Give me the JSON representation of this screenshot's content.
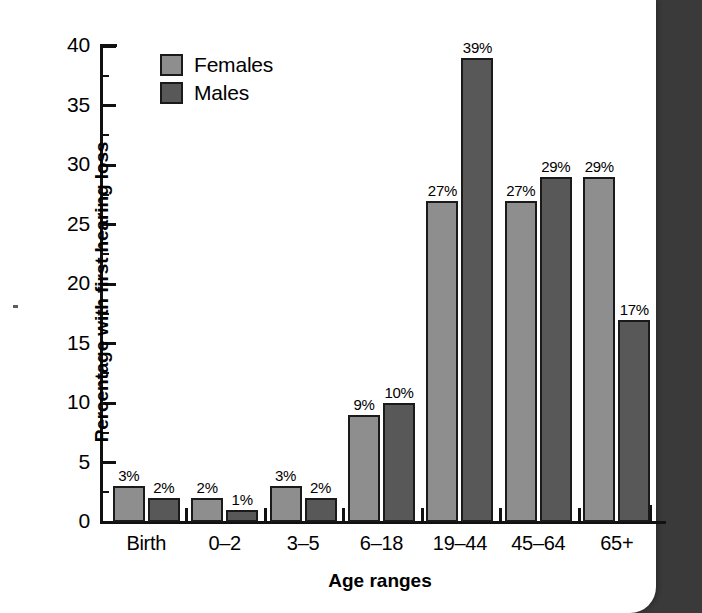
{
  "chart_data": {
    "type": "bar",
    "title": "",
    "xlabel": "Age ranges",
    "ylabel": "Percentage with first hearing loss",
    "categories": [
      "Birth",
      "0–2",
      "3–5",
      "6–18",
      "19–44",
      "45–64",
      "65+"
    ],
    "series": [
      {
        "name": "Females",
        "color": "#8e8e8e",
        "values": [
          3,
          2,
          3,
          9,
          27,
          27,
          29
        ],
        "labels": [
          "3%",
          "2%",
          "3%",
          "9%",
          "27%",
          "27%",
          "29%"
        ]
      },
      {
        "name": "Males",
        "color": "#585858",
        "values": [
          2,
          1,
          2,
          10,
          39,
          29,
          17
        ],
        "labels": [
          "2%",
          "1%",
          "2%",
          "10%",
          "39%",
          "29%",
          "17%"
        ]
      }
    ],
    "ylim": [
      0,
      40
    ],
    "yticks": [
      0,
      5,
      10,
      15,
      20,
      25,
      30,
      35,
      40
    ],
    "ytick_labels": [
      "0",
      "5",
      "10",
      "15",
      "20",
      "25",
      "30",
      "35",
      "40"
    ],
    "yminor_step": 2.5,
    "grid": false,
    "legend_position": "top-left"
  },
  "legend": {
    "items": [
      {
        "label": "Females",
        "swatch": "legend-swatch-females"
      },
      {
        "label": "Males",
        "swatch": "legend-swatch-males"
      }
    ]
  },
  "colors": {
    "females": "#8e8e8e",
    "males": "#585858",
    "axis": "#111111",
    "page": "#ffffff",
    "backdrop": "#3a3a3a"
  }
}
